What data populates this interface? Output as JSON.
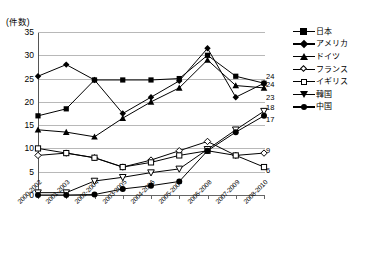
{
  "header": {
    "faint_top_text": ""
  },
  "axis": {
    "y_unit_label": "(件数)",
    "y_ticks": [
      0,
      5,
      10,
      15,
      20,
      25,
      30,
      35
    ],
    "x_labels": [
      "2000-2002",
      "2001-2003",
      "2002-2004",
      "2003-2005",
      "2004-2006",
      "2005-2007",
      "2006-2008",
      "2007-2009",
      "2008-2010"
    ]
  },
  "legend": {
    "position": "right",
    "items": [
      {
        "label": "日本",
        "marker": "filled-square",
        "icon": "series-marker-square-icon"
      },
      {
        "label": "アメリカ",
        "marker": "filled-diamond",
        "icon": "series-marker-diamond-icon"
      },
      {
        "label": "ドイツ",
        "marker": "filled-triangle",
        "icon": "series-marker-triangle-icon"
      },
      {
        "label": "フランス",
        "marker": "open-diamond",
        "icon": "series-marker-open-diamond-icon"
      },
      {
        "label": "イギリス",
        "marker": "open-square",
        "icon": "series-marker-open-square-icon"
      },
      {
        "label": "韓国",
        "marker": "open-inverted-triangle",
        "icon": "series-marker-inverted-triangle-icon"
      },
      {
        "label": "中国",
        "marker": "filled-circle",
        "icon": "series-marker-circle-icon"
      }
    ]
  },
  "end_labels": [
    {
      "value": "24",
      "series": "日本"
    },
    {
      "value": "24",
      "series": "アメリカ"
    },
    {
      "value": "23",
      "series": "ドイツ"
    },
    {
      "value": "18",
      "series": "韓国"
    },
    {
      "value": "17",
      "series": "中国"
    },
    {
      "value": "9",
      "series": "フランス"
    },
    {
      "value": "6",
      "series": "イギリス"
    }
  ],
  "chart_data": {
    "type": "line",
    "title": "",
    "xlabel": "",
    "ylabel": "(件数)",
    "ylim": [
      0,
      35
    ],
    "ytick_step": 5,
    "grid": true,
    "legend_position": "right",
    "categories": [
      "2000-2002",
      "2001-2003",
      "2002-2004",
      "2003-2005",
      "2004-2006",
      "2005-2007",
      "2006-2008",
      "2007-2009",
      "2008-2010"
    ],
    "series": [
      {
        "name": "日本",
        "marker": "filled-square",
        "values": [
          17,
          18.5,
          24.7,
          24.7,
          24.7,
          25,
          30,
          25.5,
          24
        ],
        "end_label": "24"
      },
      {
        "name": "アメリカ",
        "marker": "filled-diamond",
        "values": [
          25.5,
          28,
          24.7,
          17.5,
          21,
          24.5,
          31.5,
          21,
          24
        ],
        "end_label": "24"
      },
      {
        "name": "ドイツ",
        "marker": "filled-triangle",
        "values": [
          14,
          13.5,
          12.5,
          16.5,
          20,
          23,
          29,
          23.5,
          23
        ],
        "end_label": "23"
      },
      {
        "name": "フランス",
        "marker": "open-diamond",
        "values": [
          8.5,
          9,
          8,
          6,
          7.5,
          9.5,
          11.5,
          8.5,
          9
        ],
        "end_label": "9"
      },
      {
        "name": "イギリス",
        "marker": "open-square",
        "values": [
          10,
          9,
          8,
          6,
          7,
          8.5,
          9.5,
          8.5,
          6
        ],
        "end_label": "6"
      },
      {
        "name": "韓国",
        "marker": "open-inverted-triangle",
        "values": [
          0.5,
          0.5,
          3,
          3.8,
          4.8,
          5.6,
          9.8,
          14,
          18
        ],
        "end_label": "18"
      },
      {
        "name": "中国",
        "marker": "filled-circle",
        "values": [
          0,
          0,
          0.1,
          1.3,
          2,
          2.9,
          9.5,
          13.5,
          17
        ],
        "end_label": "17"
      }
    ]
  },
  "colors": {
    "line": "#000000",
    "grid": "#b8b8b8",
    "axis": "#666666",
    "background": "#ffffff"
  }
}
